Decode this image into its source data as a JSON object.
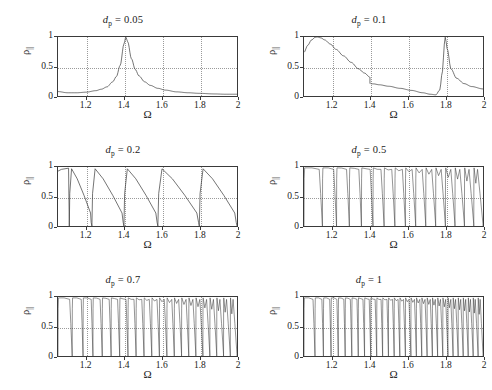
{
  "figure": {
    "axis_label_x": "Ω",
    "axis_label_y": "ρ",
    "axis_label_y_sub": "||",
    "xticks": [
      "1.2",
      "1.4",
      "1.6",
      "1.8",
      "2"
    ],
    "xtick_values": [
      1.2,
      1.4,
      1.6,
      1.8,
      2.0
    ],
    "yticks": [
      "0",
      "0.5",
      "1"
    ],
    "ytick_values": [
      0,
      0.5,
      1
    ],
    "xlim": [
      1.05,
      2.0
    ],
    "ylim": [
      0,
      1
    ],
    "line_color": "#3a3a3a",
    "grid_color": "#9a9a9a",
    "background": "#ffffff"
  },
  "panels": [
    {
      "id": "panel-dp-005",
      "title_symbol": "d",
      "title_sub": "p",
      "title_eq": " = 0.05",
      "title_full": "d_p = 0.05",
      "dp": 0.05
    },
    {
      "id": "panel-dp-01",
      "title_symbol": "d",
      "title_sub": "p",
      "title_eq": " = 0.1",
      "title_full": "d_p = 0.1",
      "dp": 0.1
    },
    {
      "id": "panel-dp-02",
      "title_symbol": "d",
      "title_sub": "p",
      "title_eq": " = 0.2",
      "title_full": "d_p = 0.2",
      "dp": 0.2
    },
    {
      "id": "panel-dp-05",
      "title_symbol": "d",
      "title_sub": "p",
      "title_eq": " = 0.5",
      "title_full": "d_p = 0.5",
      "dp": 0.5
    },
    {
      "id": "panel-dp-07",
      "title_symbol": "d",
      "title_sub": "p",
      "title_eq": " = 0.7",
      "title_full": "d_p = 0.7",
      "dp": 0.7
    },
    {
      "id": "panel-dp-1",
      "title_symbol": "d",
      "title_sub": "p",
      "title_eq": " = 1",
      "title_full": "d_p = 1",
      "dp": 1
    }
  ],
  "chart_data": [
    {
      "type": "line",
      "title": "d_p = 0.05",
      "xlabel": "Ω",
      "ylabel": "ρ_||",
      "xlim": [
        1.05,
        2.0
      ],
      "ylim": [
        0,
        1
      ],
      "grid": true,
      "description": "Single Lorentzian resonance peak reaching 1 at Ω≈1.41, low baseline ~0.03-0.08",
      "x": [
        1.05,
        1.1,
        1.15,
        1.2,
        1.25,
        1.28,
        1.31,
        1.34,
        1.36,
        1.38,
        1.4,
        1.41,
        1.42,
        1.44,
        1.46,
        1.48,
        1.51,
        1.54,
        1.58,
        1.62,
        1.68,
        1.74,
        1.8,
        1.88,
        1.94,
        2.0
      ],
      "y": [
        0.075,
        0.055,
        0.055,
        0.065,
        0.09,
        0.115,
        0.155,
        0.24,
        0.33,
        0.52,
        0.88,
        1.0,
        0.92,
        0.63,
        0.45,
        0.34,
        0.24,
        0.18,
        0.13,
        0.1,
        0.07,
        0.055,
        0.045,
        0.035,
        0.03,
        0.03
      ]
    },
    {
      "type": "line",
      "title": "d_p = 0.1",
      "xlabel": "Ω",
      "ylabel": "ρ_||",
      "xlim": [
        1.05,
        2.0
      ],
      "ylim": [
        0,
        1
      ],
      "grid": true,
      "description": "Broad peak to 1 near Ω≈1.12, decay to 0.32 at Ω=1.4 with vertical discontinuity down to 0.21, slow decay to ~0.02 near 1.75, then sharp resonance to 1 at Ω≈1.80 and decay to 0.12",
      "segments": [
        {
          "x": [
            1.05,
            1.07,
            1.09,
            1.11,
            1.12,
            1.14,
            1.16,
            1.19,
            1.22,
            1.26,
            1.3,
            1.34,
            1.37,
            1.4
          ],
          "y": [
            0.74,
            0.86,
            0.95,
            0.995,
            1.0,
            0.985,
            0.95,
            0.88,
            0.79,
            0.68,
            0.57,
            0.46,
            0.39,
            0.32
          ]
        },
        {
          "x": [
            1.4,
            1.42,
            1.45,
            1.5,
            1.56,
            1.62,
            1.68,
            1.72,
            1.75,
            1.77,
            1.785,
            1.795,
            1.8,
            1.81,
            1.83,
            1.86,
            1.9,
            1.94,
            2.0
          ],
          "y": [
            0.21,
            0.205,
            0.19,
            0.165,
            0.13,
            0.095,
            0.055,
            0.03,
            0.02,
            0.1,
            0.42,
            0.88,
            1.0,
            0.8,
            0.46,
            0.3,
            0.21,
            0.16,
            0.12
          ]
        }
      ]
    },
    {
      "type": "line",
      "title": "d_p = 0.2",
      "xlabel": "Ω",
      "ylabel": "ρ_||",
      "xlim": [
        1.05,
        2.0
      ],
      "ylim": [
        0,
        1
      ],
      "grid": true,
      "description": "Photonic band structure: plateaus at 1 with sharp band-edge drops at Ω≈1.11, 1.23, 1.40, 1.58, 1.80; each stopband followed by decaying passband",
      "band_edges": [
        1.11,
        1.23,
        1.4,
        1.58,
        1.8
      ]
    },
    {
      "type": "line",
      "title": "d_p = 0.5",
      "xlabel": "Ω",
      "ylabel": "ρ_||",
      "xlim": [
        1.05,
        2.0
      ],
      "ylim": [
        0,
        1
      ],
      "grid": true,
      "description": "Dense band structure: ~16 stopbands with flat tops at ρ=1 separated by narrow V-shaped dips to 0; dips widen with increasing Ω",
      "n_bands": 16
    },
    {
      "type": "line",
      "title": "d_p = 0.7",
      "xlabel": "Ω",
      "ylabel": "ρ_||",
      "xlim": [
        1.05,
        2.0
      ],
      "ylim": [
        0,
        1
      ],
      "grid": true,
      "description": "Denser band structure: ~22 stopbands, flat tops at ρ=1 with narrow dips to 0, widening toward Ω=2",
      "n_bands": 22
    },
    {
      "type": "line",
      "title": "d_p = 1",
      "xlabel": "Ω",
      "ylabel": "ρ_||",
      "xlim": [
        1.05,
        2.0
      ],
      "ylim": [
        0,
        1
      ],
      "grid": true,
      "description": "Densest band structure: ~30 stopbands packed across range, flat tops at ρ=1 with narrow dips to 0",
      "n_bands": 30
    }
  ]
}
